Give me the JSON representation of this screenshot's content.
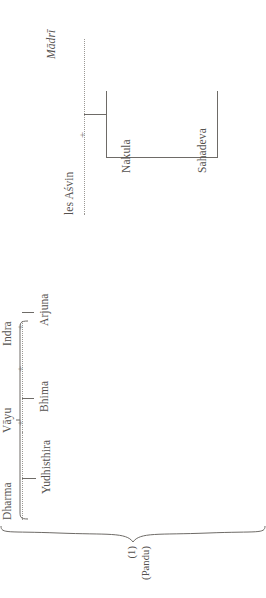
{
  "diagram": {
    "orientation": "rotated-90-ccw",
    "union_symbol": "+",
    "root": {
      "index_label": "(1)",
      "name_label": "(Pandu)"
    },
    "wives": [
      {
        "id": "kunti",
        "label": "Kuntī",
        "style": "italic"
      },
      {
        "id": "madri",
        "label": "Mādrī",
        "style": "italic"
      }
    ],
    "fathers": [
      {
        "id": "dharma",
        "label": "Dharma"
      },
      {
        "id": "vayu",
        "label": "Vāyu"
      },
      {
        "id": "indra",
        "label": "Indra"
      },
      {
        "id": "asvin",
        "label": "les Aśvin"
      }
    ],
    "children": [
      {
        "id": "yudhisthira",
        "label": "Yudhisthira",
        "father": "dharma",
        "mother": "kunti"
      },
      {
        "id": "bhima",
        "label": "Bhima",
        "father": "vayu",
        "mother": "kunti"
      },
      {
        "id": "arjuna",
        "label": "Arjuna",
        "father": "indra",
        "mother": "kunti"
      },
      {
        "id": "nakula",
        "label": "Nakula",
        "father": "asvin",
        "mother": "madri"
      },
      {
        "id": "sahadeva",
        "label": "Sahadeva",
        "father": "asvin",
        "mother": "madri"
      }
    ],
    "colors": {
      "ink": "#55524f",
      "rule": "#6e6b67",
      "dotted": "#9a9894",
      "background": "#ffffff"
    }
  }
}
